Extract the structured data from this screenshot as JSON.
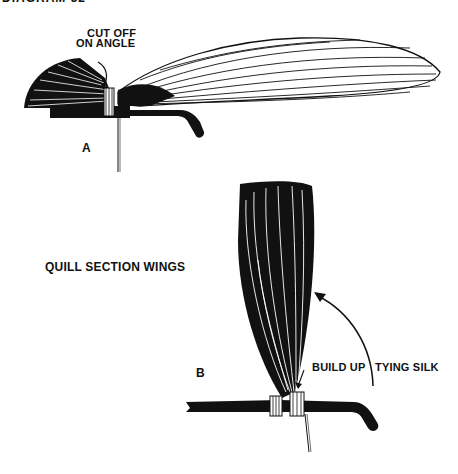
{
  "diagram": {
    "title": "DIAGRAM 32",
    "section_title": "QUILL SECTION WINGS",
    "panel_a": {
      "letter": "A",
      "annotation_line1": "CUT OFF",
      "annotation_line2": "ON ANGLE"
    },
    "panel_b": {
      "letter": "B",
      "annotation_left": "BUILD UP",
      "annotation_right": "TYING SILK"
    }
  }
}
